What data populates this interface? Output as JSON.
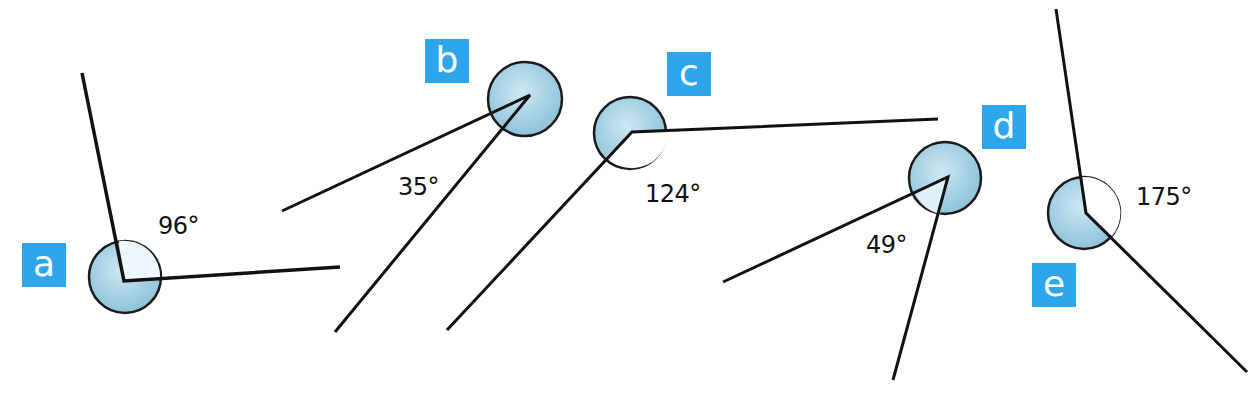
{
  "colors": {
    "label_bg": "#2ea6ec",
    "label_fg": "#ffffff",
    "circle_fill": "#a9d4e6",
    "line": "#111111"
  },
  "angles": [
    {
      "label": "a",
      "value": "96°",
      "vertex": [
        124,
        281
      ],
      "ray1": [
        82,
        73
      ],
      "ray2": [
        340,
        267
      ],
      "label_box": [
        22,
        243
      ],
      "value_pos": [
        158,
        212
      ]
    },
    {
      "label": "b",
      "value": "35°",
      "vertex": [
        530,
        95
      ],
      "ray1": [
        282,
        211
      ],
      "ray2": [
        335,
        332
      ],
      "label_box": [
        425,
        39
      ],
      "value_pos": [
        398,
        173
      ]
    },
    {
      "label": "c",
      "value": "124°",
      "vertex": [
        632,
        132
      ],
      "ray1": [
        938,
        119
      ],
      "ray2": [
        447,
        330
      ],
      "label_box": [
        667,
        52
      ],
      "value_pos": [
        645,
        180
      ]
    },
    {
      "label": "d",
      "value": "49°",
      "vertex": [
        948,
        177
      ],
      "ray1": [
        723,
        282
      ],
      "ray2": [
        893,
        380
      ],
      "label_box": [
        982,
        105
      ],
      "value_pos": [
        866,
        231
      ]
    },
    {
      "label": "e",
      "value": "175°",
      "vertex": [
        1086,
        213
      ],
      "ray1": [
        1056,
        9
      ],
      "ray2": [
        1247,
        372
      ],
      "label_box": [
        1032,
        263
      ],
      "value_pos": [
        1136,
        183
      ]
    }
  ]
}
